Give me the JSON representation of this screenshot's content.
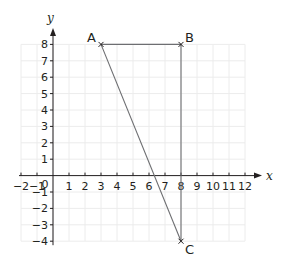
{
  "diagram": {
    "type": "coordinate-grid",
    "axes": {
      "x": {
        "label": "x",
        "min": -2,
        "max": 12,
        "ticks": [
          -2,
          -1,
          1,
          2,
          3,
          4,
          5,
          6,
          7,
          8,
          9,
          10,
          11,
          12
        ],
        "origin_label": "0"
      },
      "y": {
        "label": "y",
        "min": -4,
        "max": 8,
        "ticks": [
          8,
          7,
          6,
          5,
          4,
          3,
          2,
          1,
          -1,
          -2,
          -3,
          -4
        ]
      }
    },
    "points": [
      {
        "name": "A",
        "x": 3,
        "y": 8
      },
      {
        "name": "B",
        "x": 8,
        "y": 8
      },
      {
        "name": "C",
        "x": 8,
        "y": -4
      }
    ],
    "segments": [
      [
        "A",
        "B"
      ],
      [
        "B",
        "C"
      ],
      [
        "A",
        "C"
      ]
    ],
    "colors": {
      "grid": "#ececec",
      "axis": "#231f20",
      "shape": "#6d6e71",
      "text": "#231f20"
    }
  }
}
